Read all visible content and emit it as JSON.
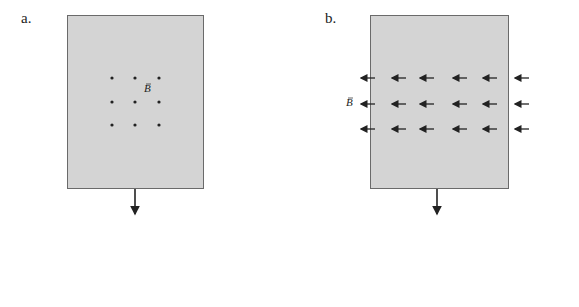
{
  "panels": [
    {
      "label": "a.",
      "field_label": "B",
      "field_direction": "out-of-page (dots)",
      "motion": "down"
    },
    {
      "label": "b.",
      "field_label": "B",
      "field_direction": "left (arrows)",
      "motion": "down"
    }
  ],
  "colors": {
    "plate": "#d4d4d4",
    "border": "#6a6a6a",
    "ink": "#222222"
  }
}
